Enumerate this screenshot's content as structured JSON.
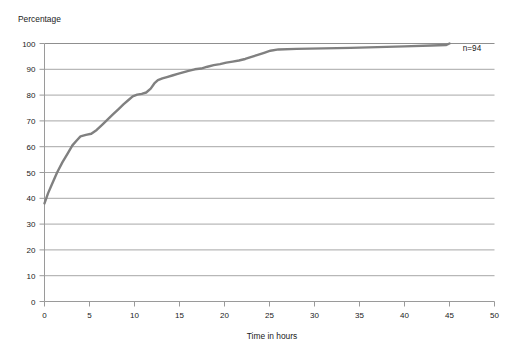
{
  "chart_data": {
    "type": "line",
    "title": "",
    "subtitle": "",
    "xlabel": "Time in hours",
    "ylabel": "Percentage",
    "xlim": [
      0,
      50
    ],
    "ylim": [
      0,
      100
    ],
    "xticks": [
      0,
      5,
      10,
      15,
      20,
      25,
      30,
      35,
      40,
      45,
      50
    ],
    "yticks": [
      0,
      10,
      20,
      30,
      40,
      50,
      60,
      70,
      80,
      90,
      100
    ],
    "grid": {
      "horizontal": true,
      "vertical": false
    },
    "legend": {
      "visible": false,
      "position": "none"
    },
    "annotations": [
      {
        "name": "sample-size",
        "text": "n=94",
        "x": 47.5,
        "y": 97
      }
    ],
    "series": [
      {
        "name": "Cumulative percentage",
        "color": "#808080",
        "line_width": 2.4,
        "x": [
          0,
          0.4,
          0.9,
          1.4,
          2.0,
          2.6,
          3.1,
          3.6,
          4.0,
          4.6,
          5.2,
          5.8,
          6.4,
          7.0,
          7.6,
          8.2,
          8.8,
          9.3,
          9.8,
          10.3,
          10.8,
          11.3,
          11.8,
          12.2,
          12.6,
          13.1,
          13.6,
          14.2,
          14.8,
          15.4,
          16.0,
          16.7,
          17.4,
          18.1,
          18.8,
          19.5,
          20.2,
          20.9,
          21.6,
          22.3,
          23.0,
          23.7,
          24.4,
          25.1,
          26.0,
          28.0,
          31.0,
          34.0,
          37.0,
          40.0,
          43.0,
          44.6,
          45.0
        ],
        "y": [
          38,
          42,
          46,
          50,
          54,
          57.5,
          60.5,
          62.5,
          64,
          64.6,
          65,
          66.5,
          68.5,
          70.5,
          72.5,
          74.5,
          76.5,
          78,
          79.5,
          80.2,
          80.5,
          81,
          82.5,
          84.5,
          85.8,
          86.5,
          87,
          87.6,
          88.2,
          88.8,
          89.4,
          90,
          90.3,
          91,
          91.6,
          92,
          92.6,
          93,
          93.4,
          94,
          94.8,
          95.6,
          96.4,
          97.2,
          97.7,
          97.9,
          98.1,
          98.3,
          98.6,
          98.9,
          99.2,
          99.4,
          100
        ]
      }
    ]
  },
  "axis": {
    "y_title": "Percentage",
    "x_title": "Time in hours"
  }
}
